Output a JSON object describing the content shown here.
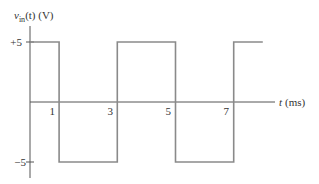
{
  "chart_data": {
    "type": "line",
    "title": "",
    "ylabel": "v_in(t) (V)",
    "ylabel_parts": {
      "main": "v",
      "sub": "in",
      "rest": "(t) (V)"
    },
    "xlabel": "t (ms)",
    "x_ticks": [
      1,
      3,
      5,
      7
    ],
    "x_tick_labels": [
      "1",
      "3",
      "5",
      "7"
    ],
    "y_ticks": [
      5,
      -5
    ],
    "y_tick_labels": [
      "+5",
      "−5"
    ],
    "xlim": [
      0,
      8.3
    ],
    "ylim": [
      -6.2,
      6.5
    ],
    "grid": false,
    "legend": null,
    "series": [
      {
        "name": "v_in(t)",
        "waveform": "square",
        "points": [
          [
            0,
            5
          ],
          [
            1,
            5
          ],
          [
            1,
            -5
          ],
          [
            3,
            -5
          ],
          [
            3,
            5
          ],
          [
            5,
            5
          ],
          [
            5,
            -5
          ],
          [
            7,
            -5
          ],
          [
            7,
            5
          ],
          [
            8,
            5
          ]
        ],
        "color": "#8a8a8a"
      }
    ],
    "amplitude_V": 5,
    "period_ms": 4
  },
  "colors": {
    "axis": "#555555",
    "waveform": "#8a8a8a",
    "text": "#333333"
  }
}
